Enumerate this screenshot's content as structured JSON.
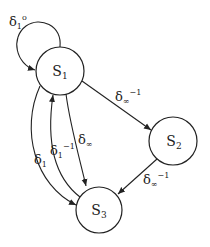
{
  "diagram": {
    "type": "state-transition",
    "nodes": [
      {
        "id": "S1",
        "label": "S",
        "subscript": "1"
      },
      {
        "id": "S2",
        "label": "S",
        "subscript": "2"
      },
      {
        "id": "S3",
        "label": "S",
        "subscript": "3"
      }
    ],
    "edges": [
      {
        "from": "S1",
        "to": "S1",
        "label": "δ",
        "subscript": "1",
        "superscript": "o"
      },
      {
        "from": "S1",
        "to": "S2",
        "label": "δ",
        "subscript": "∞",
        "superscript": "−1"
      },
      {
        "from": "S2",
        "to": "S3",
        "label": "δ",
        "subscript": "∞",
        "superscript": "−1"
      },
      {
        "from": "S1",
        "to": "S3",
        "label": "δ",
        "subscript": "∞",
        "superscript": ""
      },
      {
        "from": "S3",
        "to": "S1",
        "label": "δ",
        "subscript": "1",
        "superscript": "−1"
      },
      {
        "from": "S1",
        "to": "S3",
        "label": "δ",
        "subscript": "1",
        "superscript": ""
      }
    ]
  }
}
